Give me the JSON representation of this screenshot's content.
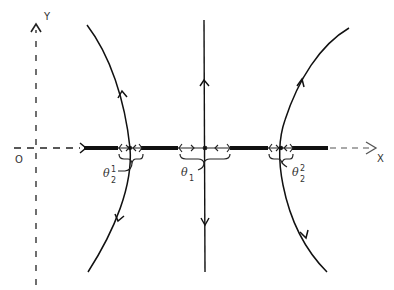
{
  "axes": {
    "x_label": "X",
    "y_label": "Y",
    "origin_label": "O"
  },
  "labels": {
    "theta1": {
      "base": "θ",
      "sub": "1"
    },
    "theta2_1": {
      "base": "θ",
      "sub": "2",
      "sup": "1"
    },
    "theta2_2": {
      "base": "θ",
      "sub": "2",
      "sup": "2"
    }
  },
  "colors": {
    "ink": "#1a1a1a",
    "background": "#ffffff"
  }
}
